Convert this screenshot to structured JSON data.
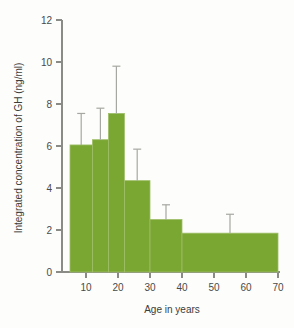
{
  "chart_data": {
    "type": "bar",
    "title": "",
    "xlabel": "Age in years",
    "ylabel": "Integrated concentration of GH (ng/ml)",
    "xlim": [
      3,
      72
    ],
    "ylim": [
      0,
      12
    ],
    "xticks": [
      10,
      20,
      30,
      40,
      50,
      60,
      70
    ],
    "yticks": [
      0,
      2,
      4,
      6,
      8,
      10,
      12
    ],
    "grid": false,
    "legend": null,
    "bar_color": "#7aa632",
    "error_color": "#a6a6a2",
    "axis_color": "#8a8a86",
    "categories": [
      "5-12",
      "12-17",
      "17-22",
      "22-30",
      "30-40",
      "40-70"
    ],
    "values": [
      6.05,
      6.3,
      7.55,
      4.35,
      2.5,
      1.85
    ],
    "errors": [
      1.5,
      1.5,
      2.25,
      1.5,
      0.7,
      0.9
    ],
    "bars": [
      {
        "label": "5-12",
        "x_start": 5,
        "x_end": 12,
        "value": 6.05,
        "error": 1.5,
        "error_top": 7.55
      },
      {
        "label": "12-17",
        "x_start": 12,
        "x_end": 17,
        "value": 6.3,
        "error": 1.5,
        "error_top": 7.8
      },
      {
        "label": "17-22",
        "x_start": 17,
        "x_end": 22,
        "value": 7.55,
        "error": 2.25,
        "error_top": 9.8
      },
      {
        "label": "22-30",
        "x_start": 22,
        "x_end": 30,
        "value": 4.35,
        "error": 1.5,
        "error_top": 5.85
      },
      {
        "label": "30-40",
        "x_start": 30,
        "x_end": 40,
        "value": 2.5,
        "error": 0.7,
        "error_top": 3.2
      },
      {
        "label": "40-70",
        "x_start": 40,
        "x_end": 70,
        "value": 1.85,
        "error": 0.9,
        "error_top": 2.75
      }
    ]
  },
  "axes": {
    "y_tick_labels": [
      "0",
      "2",
      "4",
      "6",
      "8",
      "10",
      "12"
    ],
    "x_tick_labels": [
      "10",
      "20",
      "30",
      "40",
      "50",
      "60",
      "70"
    ],
    "x_title": "Age in years",
    "y_title": "Integrated concentration of GH (ng/ml)"
  }
}
